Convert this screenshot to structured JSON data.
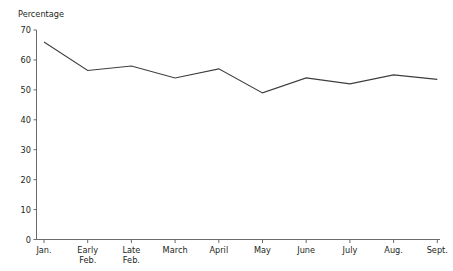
{
  "chart_data": {
    "type": "line",
    "title": "",
    "subtitle": "",
    "xlabel": "",
    "ylabel": "Percentage",
    "categories": [
      "Jan.",
      "Early Feb.",
      "Late Feb.",
      "March",
      "April",
      "May",
      "June",
      "July",
      "Aug.",
      "Sept."
    ],
    "category_lines": [
      [
        "Jan."
      ],
      [
        "Early",
        "Feb."
      ],
      [
        "Late",
        "Feb."
      ],
      [
        "March"
      ],
      [
        "April"
      ],
      [
        "May"
      ],
      [
        "June"
      ],
      [
        "July"
      ],
      [
        "Aug."
      ],
      [
        "Sept."
      ]
    ],
    "series": [
      {
        "name": "Percentage",
        "values": [
          66,
          56.5,
          58,
          54,
          57,
          49,
          54,
          52,
          55,
          53.5
        ],
        "color": "#3d3d3d"
      }
    ],
    "ylim": [
      0,
      70
    ],
    "yticks": [
      0,
      10,
      20,
      30,
      40,
      50,
      60,
      70
    ],
    "ytick_labels": [
      "0",
      "10",
      "20",
      "30",
      "40",
      "50",
      "60",
      "70"
    ],
    "grid": false,
    "legend": false,
    "legend_position": "none",
    "axis_color": "#5a5a5a",
    "background_color": "#ffffff"
  }
}
